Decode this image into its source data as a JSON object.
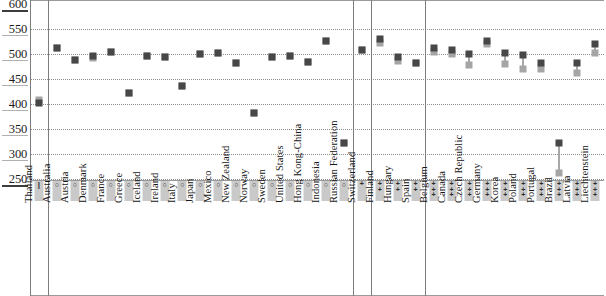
{
  "chart_data": {
    "type": "scatter",
    "title": "",
    "xlabel": "",
    "ylabel": "",
    "ylim": [
      250,
      600
    ],
    "yticks": [
      600,
      550,
      500,
      450,
      400,
      350,
      300,
      250
    ],
    "grid": true,
    "legend_position": "none",
    "series": [
      {
        "name": "dark-marker",
        "color": "#474747",
        "values": [
          403,
          512,
          489,
          497,
          504,
          422,
          497,
          494,
          437,
          500,
          502,
          483,
          383,
          495,
          497,
          484,
          527,
          322,
          509,
          530,
          495,
          483,
          512,
          508,
          500,
          527,
          503,
          498,
          483,
          322,
          482,
          520
        ]
      },
      {
        "name": "light-marker",
        "color": "#a5a5a5",
        "values": [
          409,
          512,
          489,
          492,
          504,
          422,
          497,
          494,
          437,
          500,
          502,
          483,
          383,
          495,
          497,
          484,
          527,
          322,
          509,
          523,
          486,
          483,
          505,
          501,
          478,
          520,
          481,
          470,
          471,
          262,
          463,
          503
        ]
      }
    ],
    "categories": [
      {
        "label": "Thailand",
        "symbol": "bar",
        "group": 1
      },
      {
        "label": "Australia",
        "symbol": "ring",
        "group": 2
      },
      {
        "label": "Austria",
        "symbol": "ring",
        "group": 2
      },
      {
        "label": "Denmark",
        "symbol": "ring",
        "group": 2
      },
      {
        "label": "France",
        "symbol": "ring",
        "group": 2
      },
      {
        "label": "Greece",
        "symbol": "ring",
        "group": 2
      },
      {
        "label": "Iceland",
        "symbol": "ring",
        "group": 2
      },
      {
        "label": "Ireland",
        "symbol": "ring",
        "group": 2
      },
      {
        "label": "Italy",
        "symbol": "ring",
        "group": 2
      },
      {
        "label": "Japan",
        "symbol": "ring",
        "group": 2
      },
      {
        "label": "Mexico",
        "symbol": "ring",
        "group": 2
      },
      {
        "label": "New Zealand",
        "symbol": "ring",
        "group": 2
      },
      {
        "label": "Norway",
        "symbol": "ring",
        "group": 2
      },
      {
        "label": "Sweden",
        "symbol": "ring",
        "group": 2
      },
      {
        "label": "United States",
        "symbol": "ring",
        "group": 2
      },
      {
        "label": "Hong Kong-China",
        "symbol": "ring",
        "group": 2
      },
      {
        "label": "Indonesia",
        "symbol": "ring",
        "group": 2
      },
      {
        "label": "Russian Federation",
        "symbol": "ring",
        "group": 2
      },
      {
        "label": "Switzerland",
        "symbol": "plus1",
        "group": 3
      },
      {
        "label": "Finland",
        "symbol": "plus2",
        "group": 4
      },
      {
        "label": "Hungary",
        "symbol": "plus2",
        "group": 4
      },
      {
        "label": "Spain",
        "symbol": "plus2",
        "group": 4
      },
      {
        "label": "Belgium",
        "symbol": "plus3",
        "group": 5
      },
      {
        "label": "Canada",
        "symbol": "plus3",
        "group": 5
      },
      {
        "label": "Czech Republic",
        "symbol": "plus3",
        "group": 5
      },
      {
        "label": "Germany",
        "symbol": "plus3",
        "group": 5
      },
      {
        "label": "Korea",
        "symbol": "plus3",
        "group": 5
      },
      {
        "label": "Poland",
        "symbol": "plus3",
        "group": 5
      },
      {
        "label": "Portugal",
        "symbol": "plus3",
        "group": 5
      },
      {
        "label": "Brazil",
        "symbol": "plus3",
        "group": 5
      },
      {
        "label": "Latvia",
        "symbol": "plus3",
        "group": 5
      },
      {
        "label": "Liechtenstein",
        "symbol": "plus3",
        "group": 5
      }
    ],
    "symbol_glyphs": {
      "bar": "|",
      "ring": "○",
      "plus1": "+",
      "plus2": "+ +",
      "plus3": "+ + +"
    },
    "group_boundaries_after_index": [
      17,
      18,
      21
    ]
  },
  "colors": {
    "dark_marker": "#474747",
    "light_marker": "#a5a5a5",
    "gridline": "#8e8e8e",
    "chip_background": "#c9c9c9",
    "separator": "#7d7d7d"
  }
}
